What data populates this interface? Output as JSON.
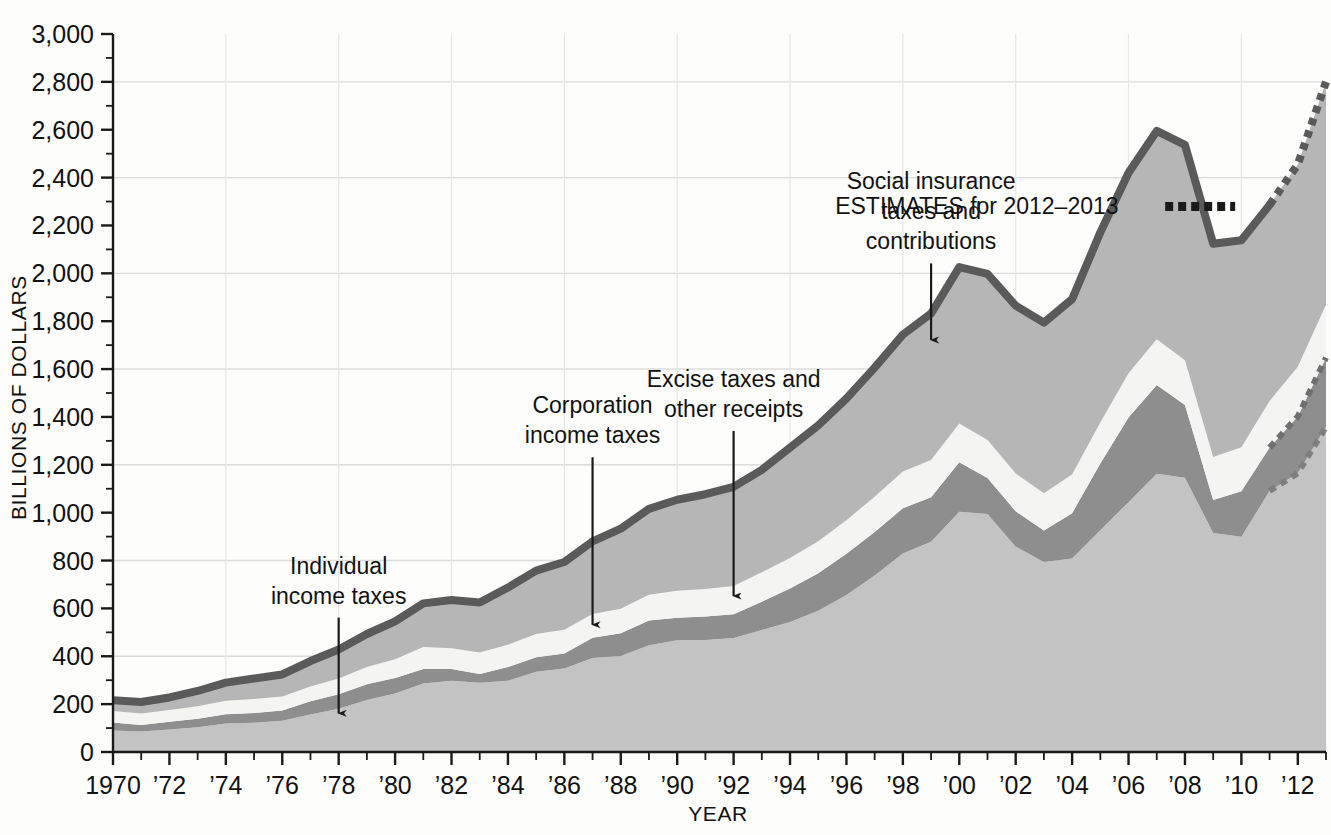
{
  "chart_data": {
    "type": "area",
    "title": "",
    "subtitle": "",
    "xlabel": "YEAR",
    "ylabel": "BILLIONS OF DOLLARS",
    "xlim": [
      1970,
      2013
    ],
    "ylim": [
      0,
      3000
    ],
    "ytick_step": 200,
    "yminor_step": 100,
    "grid": true,
    "grid_lines_at": [
      400,
      800,
      1200,
      1600,
      2000,
      2400,
      2800
    ],
    "legend_position": "inline-annotations",
    "stacked": true,
    "stack_order_bottom_to_top": [
      "Individual income taxes",
      "Corporation income taxes",
      "Excise taxes and other receipts",
      "Social insurance taxes and contributions"
    ],
    "x": [
      1970,
      1971,
      1972,
      1973,
      1974,
      1975,
      1976,
      1977,
      1978,
      1979,
      1980,
      1981,
      1982,
      1983,
      1984,
      1985,
      1986,
      1987,
      1988,
      1989,
      1990,
      1991,
      1992,
      1993,
      1994,
      1995,
      1996,
      1997,
      1998,
      1999,
      2000,
      2001,
      2002,
      2003,
      2004,
      2005,
      2006,
      2007,
      2008,
      2009,
      2010,
      2011,
      2012,
      2013
    ],
    "xtick_labels": [
      "1970",
      "’72",
      "’74",
      "’76",
      "’78",
      "’80",
      "’82",
      "’84",
      "’86",
      "’88",
      "’90",
      "’92",
      "’94",
      "’96",
      "’98",
      "’00",
      "’02",
      "’04",
      "’06",
      "’08",
      "’10",
      "’12"
    ],
    "ytick_labels": [
      "0",
      "200",
      "400",
      "600",
      "800",
      "1,000",
      "1,200",
      "1,400",
      "1,600",
      "1,800",
      "2,000",
      "2,200",
      "2,400",
      "2,600",
      "2,800",
      "3,000"
    ],
    "series": [
      {
        "name": "Individual income taxes",
        "color": "#c3c3c3",
        "values": [
          90,
          86,
          94,
          103,
          119,
          122,
          131,
          157,
          181,
          217,
          244,
          286,
          298,
          289,
          298,
          335,
          349,
          393,
          401,
          446,
          467,
          468,
          476,
          510,
          543,
          590,
          656,
          737,
          829,
          879,
          1004,
          994,
          858,
          794,
          809,
          927,
          1044,
          1163,
          1146,
          915,
          899,
          1091,
          1165,
          1359
        ]
      },
      {
        "name": "Corporation income taxes",
        "color": "#8e8e8e",
        "values": [
          33,
          27,
          32,
          36,
          39,
          41,
          42,
          55,
          60,
          66,
          65,
          61,
          49,
          37,
          57,
          61,
          63,
          84,
          95,
          103,
          94,
          98,
          100,
          118,
          140,
          157,
          172,
          182,
          189,
          185,
          207,
          151,
          148,
          132,
          189,
          278,
          354,
          370,
          304,
          138,
          191,
          181,
          237,
          288
        ]
      },
      {
        "name": "Excise taxes and other receipts",
        "color": "#f4f4f2",
        "values": [
          48,
          48,
          49,
          52,
          56,
          58,
          59,
          62,
          66,
          72,
          79,
          92,
          87,
          90,
          93,
          97,
          99,
          100,
          103,
          108,
          113,
          115,
          118,
          123,
          128,
          134,
          140,
          148,
          154,
          156,
          162,
          159,
          158,
          155,
          161,
          172,
          184,
          192,
          187,
          180,
          183,
          195,
          208,
          222
        ]
      },
      {
        "name": "Social insurance taxes and contributions",
        "color": "#b6b6b6",
        "values": [
          45,
          48,
          53,
          64,
          76,
          86,
          92,
          106,
          121,
          138,
          158,
          182,
          201,
          209,
          239,
          265,
          283,
          303,
          334,
          359,
          380,
          396,
          414,
          428,
          461,
          484,
          509,
          539,
          572,
          612,
          653,
          694,
          701,
          713,
          733,
          794,
          838,
          870,
          900,
          891,
          865,
          819,
          845,
          931
        ]
      }
    ],
    "total_line_color": "#5a5a5a",
    "estimate_style": "dotted",
    "estimate_years": [
      2012,
      2013
    ],
    "estimate_total_2013": 2800,
    "annotations": [
      {
        "id": "estimates-legend",
        "text": "ESTIMATES for 2012–2013",
        "swatch": "dotted-line",
        "x": 1995.6,
        "y": 2250
      },
      {
        "id": "individual-income-taxes",
        "lines": [
          "Individual",
          "income taxes"
        ],
        "arrow_from_year": 1978,
        "arrow_from_value": 620,
        "arrow_to_value": 120
      },
      {
        "id": "corporation-income-taxes",
        "lines": [
          "Corporation",
          "income taxes"
        ],
        "arrow_from_year": 1987,
        "arrow_from_value": 1290,
        "arrow_to_value": 490
      },
      {
        "id": "excise-other-receipts",
        "lines": [
          "Excise taxes and",
          "other receipts"
        ],
        "arrow_from_year": 1992,
        "arrow_from_value": 1400,
        "arrow_to_value": 610
      },
      {
        "id": "social-insurance",
        "lines": [
          "Social insurance",
          "taxes and",
          "contributions"
        ],
        "arrow_from_year": 1999,
        "arrow_from_value": 2100,
        "arrow_to_value": 1680
      }
    ]
  }
}
